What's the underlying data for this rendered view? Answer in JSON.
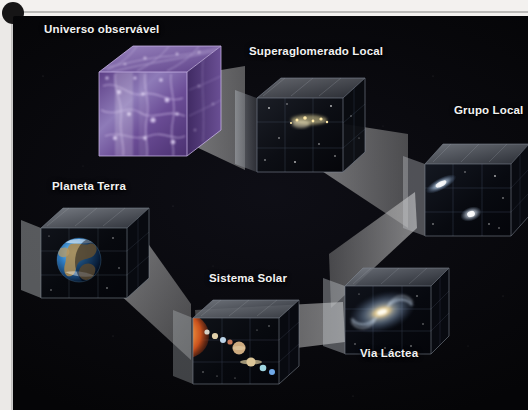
{
  "figure": {
    "kind": "cosmic-scale-nested-cubes-diagram",
    "background_color": "#050507",
    "label_color": "#f2f2f2",
    "credit": "ELMA CAPARROZ"
  },
  "labels": [
    {
      "id": "universo",
      "text": "Universo observável",
      "x": 44,
      "y": 23
    },
    {
      "id": "superaglomerado",
      "text": "Superaglomerado Local",
      "x": 249,
      "y": 45
    },
    {
      "id": "grupo",
      "text": "Grupo Local",
      "x": 454,
      "y": 104
    },
    {
      "id": "planeta",
      "text": "Planeta Terra",
      "x": 52,
      "y": 180
    },
    {
      "id": "sistema",
      "text": "Sistema Solar",
      "x": 209,
      "y": 272
    },
    {
      "id": "via",
      "text": "Via Láctea",
      "x": 360,
      "y": 347
    }
  ],
  "cubes": [
    {
      "id": "universo-observavel",
      "label": "Universo observável",
      "content": "cosmic-web filaments",
      "accent": "#8f6fc4",
      "x": 85,
      "y": 38,
      "w": 124,
      "h": 112
    },
    {
      "id": "superaglomerado-local",
      "label": "Superaglomerado Local",
      "content": "galaxy cluster points",
      "accent": "#d8cba0",
      "x": 232,
      "y": 62,
      "w": 110,
      "h": 102
    },
    {
      "id": "grupo-local",
      "label": "Grupo Local",
      "content": "nearby galaxies",
      "accent": "#cfe0f2",
      "x": 402,
      "y": 130,
      "w": 112,
      "h": 100
    },
    {
      "id": "planeta-terra",
      "label": "Planeta Terra",
      "content": "planet earth",
      "accent": "#2f7ec4",
      "x": 22,
      "y": 196,
      "w": 122,
      "h": 92
    },
    {
      "id": "sistema-solar",
      "label": "Sistema Solar",
      "content": "sun and planets",
      "accent": "#d2713a",
      "x": 178,
      "y": 288,
      "w": 122,
      "h": 82
    },
    {
      "id": "via-lactea",
      "label": "Via Láctea",
      "content": "milky way spiral galaxy",
      "accent": "#b9cde6",
      "x": 322,
      "y": 256,
      "w": 116,
      "h": 86
    }
  ],
  "connectors": [
    {
      "id": "universo-to-superaglomerado",
      "from": "Universo observável",
      "to": "Superaglomerado Local"
    },
    {
      "id": "superaglomerado-to-grupo",
      "from": "Superaglomerado Local",
      "to": "Grupo Local"
    },
    {
      "id": "grupo-to-via",
      "from": "Grupo Local",
      "to": "Via Láctea"
    },
    {
      "id": "via-to-sistema",
      "from": "Via Láctea",
      "to": "Sistema Solar"
    },
    {
      "id": "sistema-to-planeta",
      "from": "Sistema Solar",
      "to": "Planeta Terra"
    }
  ]
}
